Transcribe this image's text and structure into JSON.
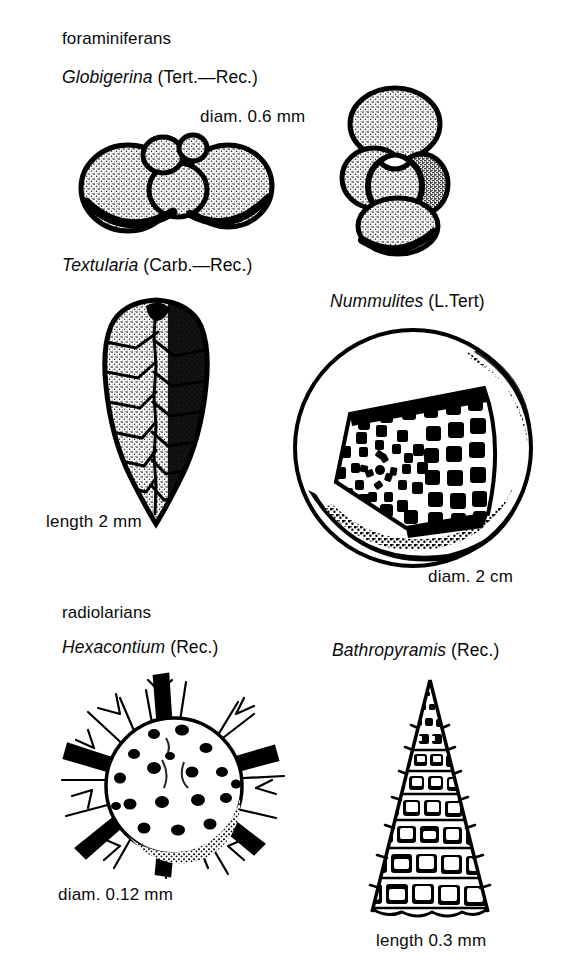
{
  "plate": {
    "background": "#ffffff",
    "ink": "#000000",
    "width": 566,
    "height": 965
  },
  "groups": [
    {
      "id": "foraminiferans",
      "label": "foraminiferans"
    },
    {
      "id": "radiolarians",
      "label": "radiolarians"
    }
  ],
  "specimens": [
    {
      "id": "globigerina",
      "genus": "Globigerina",
      "age": "(Tert.—Rec.)",
      "scale": "diam. 0.6 mm",
      "group": "foraminiferans",
      "views": [
        "spiral-view",
        "side-view"
      ]
    },
    {
      "id": "textularia",
      "genus": "Textularia",
      "age": "(Carb.—Rec.)",
      "scale": "length 2 mm",
      "group": "foraminiferans",
      "views": [
        "biserial-test"
      ]
    },
    {
      "id": "nummulites",
      "genus": "Nummulites",
      "age": "(L.Tert)",
      "scale": "diam. 2 cm",
      "group": "foraminiferans",
      "views": [
        "disc-with-cutaway"
      ]
    },
    {
      "id": "hexacontium",
      "genus": "Hexacontium",
      "age": "(Rec.)",
      "scale": "diam. 0.12 mm",
      "group": "radiolarians",
      "views": [
        "spined-sphere"
      ]
    },
    {
      "id": "bathropyramis",
      "genus": "Bathropyramis",
      "age": "(Rec.)",
      "scale": "length 0.3 mm",
      "group": "radiolarians",
      "views": [
        "latticed-cone"
      ]
    }
  ]
}
